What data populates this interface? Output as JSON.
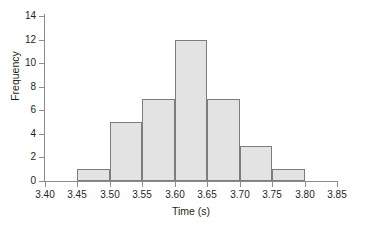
{
  "chart_data": {
    "type": "bar",
    "title": "",
    "subtitle": "",
    "xlabel": "Time (s)",
    "ylabel": "Frequency",
    "grid": false,
    "legend": null,
    "xlim": [
      3.4,
      3.85
    ],
    "ylim": [
      0,
      14
    ],
    "x_ticks": [
      "3.40",
      "3.45",
      "3.50",
      "3.55",
      "3.60",
      "3.65",
      "3.70",
      "3.75",
      "3.80",
      "3.85"
    ],
    "x_tick_values": [
      3.4,
      3.45,
      3.5,
      3.55,
      3.6,
      3.65,
      3.7,
      3.75,
      3.8,
      3.85
    ],
    "y_ticks": [
      "0",
      "2",
      "4",
      "6",
      "8",
      "10",
      "12",
      "14"
    ],
    "y_tick_values": [
      0,
      2,
      4,
      6,
      8,
      10,
      12,
      14
    ],
    "bin_width": 0.05,
    "bin_edges": [
      3.45,
      3.5,
      3.55,
      3.6,
      3.65,
      3.7,
      3.75,
      3.8
    ],
    "categories": [
      "3.45-3.50",
      "3.50-3.55",
      "3.55-3.60",
      "3.60-3.65",
      "3.65-3.70",
      "3.70-3.75",
      "3.75-3.80"
    ],
    "values": [
      1,
      5,
      7,
      12,
      7,
      3,
      1
    ],
    "total_count": 36,
    "bar_fill_color": "#e3e3e3",
    "bar_edge_color": "#7d7d7d",
    "axis_color": "#8c8c8c",
    "text_color": "#231f20",
    "background_color": "#ffffff"
  }
}
